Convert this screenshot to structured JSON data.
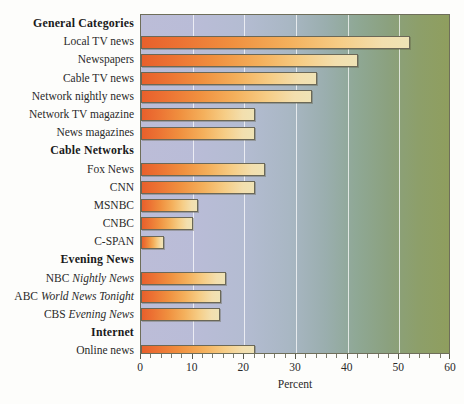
{
  "chart_data": {
    "type": "bar",
    "orientation": "horizontal",
    "title": "",
    "xlabel": "Percent",
    "ylabel": "",
    "xlim": [
      0,
      60
    ],
    "xticks": [
      0,
      10,
      20,
      30,
      40,
      50,
      60
    ],
    "xtick_labels": [
      "0",
      "10",
      "20",
      "30",
      "40",
      "50",
      "60"
    ],
    "minor_tick_step": 2,
    "grid": "vertical-major-only",
    "legend": "none",
    "bar_color_start": "#E8602C",
    "bar_color_end": "#EFE3B6",
    "plot_bg_start": "#BCBDD8",
    "plot_bg_end": "#8F9E5E",
    "rows": [
      {
        "kind": "header",
        "label": "General Categories"
      },
      {
        "kind": "bar",
        "label": "Local TV news",
        "value": 52
      },
      {
        "kind": "bar",
        "label": "Newspapers",
        "value": 42
      },
      {
        "kind": "bar",
        "label": "Cable TV news",
        "value": 34
      },
      {
        "kind": "bar",
        "label": "Network nightly news",
        "value": 33
      },
      {
        "kind": "bar",
        "label": "Network TV magazine",
        "value": 22
      },
      {
        "kind": "bar",
        "label": "News magazines",
        "value": 22
      },
      {
        "kind": "header",
        "label": "Cable Networks"
      },
      {
        "kind": "bar",
        "label": "Fox News",
        "value": 24
      },
      {
        "kind": "bar",
        "label": "CNN",
        "value": 22
      },
      {
        "kind": "bar",
        "label": "MSNBC",
        "value": 11
      },
      {
        "kind": "bar",
        "label": "CNBC",
        "value": 10
      },
      {
        "kind": "bar",
        "label": "C-SPAN",
        "value": 4.5
      },
      {
        "kind": "header",
        "label": "Evening News"
      },
      {
        "kind": "bar",
        "label": "NBC Nightly News",
        "label_roman": "NBC ",
        "label_italic": "Nightly News",
        "value": 16.5
      },
      {
        "kind": "bar",
        "label": "ABC World News Tonight",
        "label_roman": "ABC ",
        "label_italic": "World News Tonight",
        "value": 15.5
      },
      {
        "kind": "bar",
        "label": "CBS Evening News",
        "label_roman": "CBS ",
        "label_italic": "Evening News",
        "value": 15.3
      },
      {
        "kind": "header",
        "label": "Internet"
      },
      {
        "kind": "bar",
        "label": "Online news",
        "value": 22
      }
    ]
  }
}
